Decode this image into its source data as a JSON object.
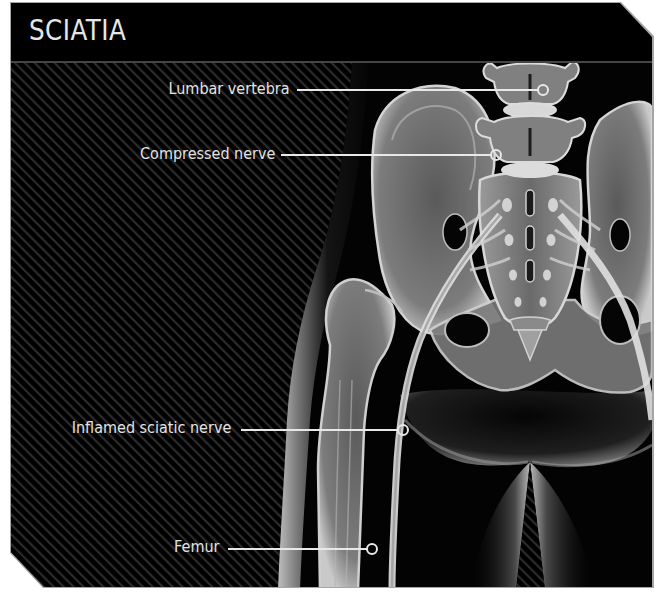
{
  "header": {
    "title": "SCIATIA"
  },
  "colors": {
    "panel_background": "#000000",
    "stripe": "#2b2b2b",
    "border": "#9a9a9a",
    "text": "#e4e4e4",
    "callout_line": "#e8e8e8"
  },
  "callouts": [
    {
      "id": "lumbar-vertebra",
      "label": "Lumbar vertebra"
    },
    {
      "id": "compressed-nerve",
      "label": "Compressed nerve"
    },
    {
      "id": "inflamed-sciatic-nerve",
      "label": "Inflamed sciatic nerve"
    },
    {
      "id": "femur",
      "label": "Femur"
    }
  ]
}
